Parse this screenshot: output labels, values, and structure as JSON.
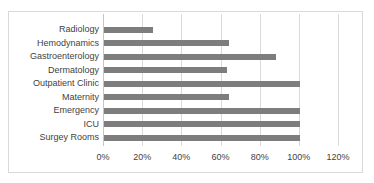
{
  "chart_data": {
    "type": "bar",
    "orientation": "horizontal",
    "title": "",
    "categories": [
      "Radiology",
      "Hemodynamics",
      "Gastroenterology",
      "Dermatology",
      "Outpatient Clinic",
      "Maternity",
      "Emergency",
      "ICU",
      "Surgey Rooms"
    ],
    "values": [
      25,
      64,
      88,
      63,
      100,
      64,
      100,
      100,
      100
    ],
    "unit": "%",
    "xlabel": "",
    "ylabel": "",
    "xlim": [
      0,
      120
    ],
    "x_tick_step": 20,
    "x_tick_labels": [
      "0%",
      "20%",
      "40%",
      "60%",
      "80%",
      "100%",
      "120%"
    ],
    "grid": "vertical-gridlines",
    "legend": "none",
    "colors": {
      "bar": "#7d7d7d",
      "gridline": "#d9d9d9",
      "axis_line": "#c6c6c6",
      "frame_border": "#d9d9d9",
      "text": "#3f3f3f",
      "background": "#ffffff"
    }
  }
}
